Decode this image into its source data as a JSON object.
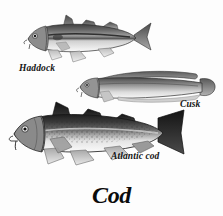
{
  "plate": {
    "title": "Cod",
    "background_color": "#fdfdfd",
    "ink_color": "#141414",
    "style": "grayscale engraving illustration plate"
  },
  "figures": [
    {
      "id": "haddock",
      "label": "Haddock",
      "common_name": "Haddock",
      "position": "upper-left",
      "label_position": "below-head-left",
      "traits": "dark olive back, pale silvery belly, dark lateral line, three dorsal fins, forked tail, small chin barbel",
      "body_dark": "#555555",
      "body_mid": "#8e8e8e",
      "body_light": "#e9e9e9"
    },
    {
      "id": "cusk",
      "label": "Cusk",
      "common_name": "Cusk",
      "position": "middle-right",
      "label_position": "below-tail-right",
      "traits": "elongated eel-like body, single continuous long dorsal fin, rounded tail, chin barbel",
      "body_dark": "#5d5d5d",
      "body_mid": "#949494",
      "body_light": "#ededed"
    },
    {
      "id": "atlantic-cod",
      "label": "Atlantic cod",
      "common_name": "Atlantic cod",
      "position": "lower-left",
      "label_position": "below-body-right",
      "traits": "heavy speckled body, pale lateral line, three dorsal fins, two anal fins, squared tail, prominent chin barbel",
      "body_dark": "#262626",
      "body_mid": "#6f6f6f",
      "body_light": "#efefef"
    }
  ]
}
